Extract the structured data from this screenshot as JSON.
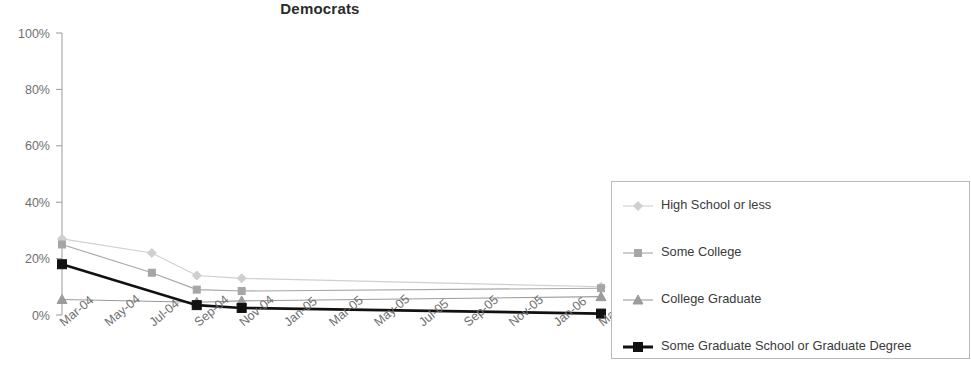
{
  "chart_data": {
    "type": "line",
    "title": "Democrats",
    "xlabel": "",
    "ylabel": "",
    "ylim": [
      0,
      100
    ],
    "yticks": [
      "0%",
      "20%",
      "40%",
      "60%",
      "80%",
      "100%"
    ],
    "ytick_values": [
      0,
      20,
      40,
      60,
      80,
      100
    ],
    "grid": false,
    "legend_position": "right",
    "categories": [
      "Mar-04",
      "May-04",
      "Jul-04",
      "Sep-04",
      "Nov-04",
      "Jan-05",
      "Mar-05",
      "May-05",
      "Jul-05",
      "Sep-05",
      "Nov-05",
      "Jan-06",
      "Mar-06"
    ],
    "series": [
      {
        "name": "High School or less",
        "color": "#cfcfcf",
        "marker": "diamond",
        "marker_x_indices": [
          0,
          2,
          3,
          4,
          12
        ],
        "values": [
          27,
          null,
          22,
          14,
          13,
          null,
          null,
          null,
          null,
          null,
          null,
          null,
          10
        ]
      },
      {
        "name": "Some College",
        "color": "#a6a6a6",
        "marker": "square",
        "marker_x_indices": [
          0,
          2,
          3,
          4,
          12
        ],
        "values": [
          25,
          null,
          15,
          9,
          8.5,
          null,
          null,
          null,
          null,
          null,
          null,
          null,
          9.5
        ]
      },
      {
        "name": "College Graduate",
        "color": "#9b9b9b",
        "marker": "triangle",
        "marker_x_indices": [
          0,
          3,
          4,
          12
        ],
        "values": [
          5.5,
          null,
          null,
          4.5,
          5,
          null,
          null,
          null,
          null,
          null,
          null,
          null,
          6.5
        ]
      },
      {
        "name": "Some Graduate School or Graduate Degree",
        "color": "#111111",
        "marker": "square",
        "marker_x_indices": [
          0,
          3,
          4,
          12
        ],
        "values": [
          18,
          null,
          null,
          3.5,
          2.5,
          null,
          null,
          null,
          null,
          null,
          null,
          null,
          0.5
        ]
      }
    ]
  },
  "legend": {
    "entries": [
      {
        "label": "High School or less"
      },
      {
        "label": "Some College"
      },
      {
        "label": "College Graduate"
      },
      {
        "label": "Some Graduate School or Graduate Degree"
      }
    ]
  }
}
